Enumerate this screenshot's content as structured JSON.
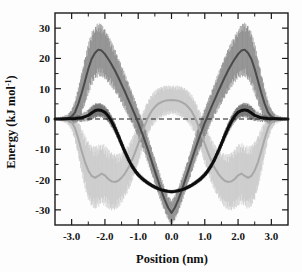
{
  "figure": {
    "background_color": "#fdfdfd",
    "frame_color": "#1a1a1a"
  },
  "chart_data": {
    "type": "line",
    "title": "",
    "subtitle": "",
    "xlabel": "Position (nm)",
    "ylabel": "Energy (kJ mol",
    "ylabel_superscript": "-1",
    "ylabel_suffix": ")",
    "xlim": [
      -3.5,
      3.5
    ],
    "ylim": [
      -35,
      35
    ],
    "xticks": [
      -3.0,
      -2.0,
      -1.0,
      0.0,
      1.0,
      2.0,
      3.0
    ],
    "xtick_labels": [
      "-3.0",
      "-2.0",
      "-1.0",
      "0.0",
      "1.0",
      "2.0",
      "3.0"
    ],
    "yticks": [
      -30,
      -20,
      -10,
      0,
      10,
      20,
      30
    ],
    "ytick_labels": [
      "-30",
      "-20",
      "-10",
      "0",
      "10",
      "20",
      "30"
    ],
    "minor_xticks": [
      -3.5,
      -2.5,
      -1.5,
      -0.5,
      0.5,
      1.5,
      2.5,
      3.5
    ],
    "minor_yticks": [
      -25,
      -15,
      -5,
      5,
      15,
      25
    ],
    "grid": false,
    "legend_position": "none",
    "zero_line": {
      "value": 0,
      "style": "dashed",
      "color": "#1a1a1a"
    },
    "series": [
      {
        "name": "total-energy",
        "color": "#0d0d0d",
        "width": 3.0,
        "error_color": "#5a5a5a",
        "x": [
          -3.5,
          -3.3,
          -3.1,
          -2.9,
          -2.7,
          -2.5,
          -2.4,
          -2.3,
          -2.2,
          -2.1,
          -2.0,
          -1.9,
          -1.8,
          -1.7,
          -1.6,
          -1.5,
          -1.4,
          -1.3,
          -1.2,
          -1.1,
          -1.0,
          -0.9,
          -0.8,
          -0.7,
          -0.6,
          -0.5,
          -0.4,
          -0.3,
          -0.2,
          -0.1,
          0.0,
          0.1,
          0.2,
          0.3,
          0.4,
          0.5,
          0.6,
          0.7,
          0.8,
          0.9,
          1.0,
          1.1,
          1.2,
          1.3,
          1.4,
          1.5,
          1.6,
          1.7,
          1.8,
          1.9,
          2.0,
          2.1,
          2.2,
          2.3,
          2.4,
          2.5,
          2.7,
          2.9,
          3.1,
          3.3,
          3.5
        ],
        "y": [
          0.0,
          0.0,
          0.1,
          0.2,
          0.4,
          1.2,
          2.0,
          2.7,
          3.0,
          2.8,
          2.2,
          1.0,
          -0.8,
          -3.0,
          -5.5,
          -8.2,
          -10.8,
          -13.2,
          -15.3,
          -17.0,
          -18.4,
          -19.5,
          -20.4,
          -21.2,
          -21.9,
          -22.5,
          -23.0,
          -23.4,
          -23.7,
          -23.9,
          -24.0,
          -23.9,
          -23.7,
          -23.4,
          -23.0,
          -22.5,
          -21.9,
          -21.2,
          -20.4,
          -19.5,
          -18.4,
          -17.0,
          -15.3,
          -13.2,
          -10.8,
          -8.2,
          -5.5,
          -3.0,
          -0.8,
          1.0,
          2.2,
          2.8,
          3.0,
          2.7,
          2.0,
          1.2,
          0.4,
          0.2,
          0.1,
          0.0,
          0.0
        ],
        "err": [
          0.2,
          0.3,
          0.5,
          0.8,
          1.2,
          1.6,
          1.9,
          2.0,
          2.0,
          1.9,
          1.8,
          1.7,
          1.6,
          1.5,
          1.4,
          1.3,
          1.2,
          1.1,
          1.0,
          0.9,
          0.8,
          0.8,
          0.7,
          0.7,
          0.6,
          0.6,
          0.6,
          0.5,
          0.5,
          0.5,
          0.5,
          0.5,
          0.5,
          0.5,
          0.6,
          0.6,
          0.6,
          0.7,
          0.7,
          0.8,
          0.8,
          0.9,
          1.0,
          1.1,
          1.2,
          1.3,
          1.4,
          1.5,
          1.6,
          1.7,
          1.8,
          1.9,
          2.0,
          2.0,
          1.9,
          1.6,
          1.2,
          0.8,
          0.5,
          0.3,
          0.2
        ]
      },
      {
        "name": "repulsive-component",
        "color": "#4a4a4a",
        "width": 2.0,
        "error_color": "#7d7d7d",
        "x": [
          -3.5,
          -3.3,
          -3.1,
          -3.0,
          -2.9,
          -2.8,
          -2.7,
          -2.6,
          -2.5,
          -2.4,
          -2.3,
          -2.2,
          -2.1,
          -2.0,
          -1.9,
          -1.8,
          -1.7,
          -1.6,
          -1.5,
          -1.4,
          -1.3,
          -1.2,
          -1.1,
          -1.0,
          -0.9,
          -0.8,
          -0.7,
          -0.6,
          -0.5,
          -0.4,
          -0.3,
          -0.2,
          -0.1,
          0.0,
          0.1,
          0.2,
          0.3,
          0.4,
          0.5,
          0.6,
          0.7,
          0.8,
          0.9,
          1.0,
          1.1,
          1.2,
          1.3,
          1.4,
          1.5,
          1.6,
          1.7,
          1.8,
          1.9,
          2.0,
          2.1,
          2.2,
          2.3,
          2.4,
          2.5,
          2.6,
          2.7,
          2.8,
          2.9,
          3.0,
          3.1,
          3.3,
          3.5
        ],
        "y": [
          0.0,
          0.1,
          0.3,
          0.8,
          2.2,
          5.0,
          8.5,
          12.5,
          16.5,
          19.8,
          21.8,
          22.9,
          22.6,
          21.4,
          19.8,
          18.0,
          16.0,
          13.8,
          11.4,
          9.0,
          6.5,
          4.0,
          1.4,
          -1.3,
          -4.2,
          -7.2,
          -10.4,
          -13.8,
          -17.2,
          -20.5,
          -23.8,
          -26.8,
          -29.3,
          -31.0,
          -29.3,
          -26.8,
          -23.8,
          -20.5,
          -17.2,
          -13.8,
          -10.4,
          -7.2,
          -4.2,
          -1.3,
          1.4,
          4.0,
          6.5,
          9.0,
          11.4,
          13.8,
          16.0,
          18.0,
          19.8,
          21.4,
          22.6,
          22.9,
          21.8,
          19.8,
          16.5,
          12.5,
          8.5,
          5.0,
          2.2,
          0.8,
          0.3,
          0.1,
          0.0
        ],
        "err": [
          0.3,
          0.6,
          1.2,
          2.0,
          3.2,
          4.5,
          5.6,
          6.4,
          7.0,
          7.3,
          7.4,
          7.3,
          7.1,
          6.8,
          6.5,
          6.2,
          5.9,
          5.6,
          5.3,
          5.0,
          4.7,
          4.4,
          4.2,
          4.0,
          3.9,
          3.8,
          3.7,
          3.6,
          3.5,
          3.5,
          3.4,
          3.4,
          3.4,
          3.4,
          3.4,
          3.4,
          3.4,
          3.5,
          3.5,
          3.6,
          3.7,
          3.8,
          3.9,
          4.0,
          4.2,
          4.4,
          4.7,
          5.0,
          5.3,
          5.6,
          5.9,
          6.2,
          6.5,
          6.8,
          7.1,
          7.3,
          7.4,
          7.3,
          7.0,
          6.4,
          5.6,
          4.5,
          3.2,
          2.0,
          1.2,
          0.6,
          0.3
        ]
      },
      {
        "name": "attractive-component",
        "color": "#a8a8a8",
        "width": 2.0,
        "error_color": "#c4c4c4",
        "x": [
          -3.5,
          -3.3,
          -3.1,
          -3.0,
          -2.9,
          -2.8,
          -2.7,
          -2.6,
          -2.5,
          -2.4,
          -2.3,
          -2.2,
          -2.1,
          -2.0,
          -1.9,
          -1.8,
          -1.7,
          -1.6,
          -1.5,
          -1.4,
          -1.3,
          -1.2,
          -1.1,
          -1.0,
          -0.9,
          -0.8,
          -0.7,
          -0.6,
          -0.5,
          -0.4,
          -0.3,
          -0.2,
          -0.1,
          0.0,
          0.1,
          0.2,
          0.3,
          0.4,
          0.5,
          0.6,
          0.7,
          0.8,
          0.9,
          1.0,
          1.1,
          1.2,
          1.3,
          1.4,
          1.5,
          1.6,
          1.7,
          1.8,
          1.9,
          2.0,
          2.1,
          2.2,
          2.3,
          2.4,
          2.5,
          2.6,
          2.7,
          2.8,
          2.9,
          3.0,
          3.1,
          3.3,
          3.5
        ],
        "y": [
          0.0,
          -0.1,
          -0.4,
          -1.0,
          -3.0,
          -6.5,
          -10.5,
          -14.2,
          -17.0,
          -18.8,
          -19.4,
          -18.8,
          -18.0,
          -18.6,
          -19.8,
          -20.6,
          -20.8,
          -20.4,
          -19.4,
          -18.0,
          -16.2,
          -13.9,
          -11.2,
          -8.2,
          -5.0,
          -2.0,
          0.6,
          2.6,
          4.0,
          5.0,
          5.6,
          6.0,
          6.2,
          6.3,
          6.2,
          6.0,
          5.6,
          5.0,
          4.0,
          2.6,
          0.6,
          -2.0,
          -5.0,
          -8.2,
          -11.2,
          -13.9,
          -16.2,
          -18.0,
          -19.4,
          -20.4,
          -20.8,
          -20.6,
          -19.8,
          -18.6,
          -18.0,
          -18.8,
          -19.4,
          -18.8,
          -17.0,
          -14.2,
          -10.5,
          -6.5,
          -3.0,
          -1.0,
          -0.4,
          -0.1,
          0.0
        ],
        "err": [
          0.3,
          0.6,
          1.3,
          2.2,
          3.5,
          5.0,
          6.2,
          7.2,
          7.9,
          8.3,
          8.5,
          8.5,
          8.4,
          8.3,
          8.1,
          7.9,
          7.6,
          7.3,
          7.0,
          6.7,
          6.4,
          6.1,
          5.8,
          5.5,
          5.2,
          5.0,
          4.8,
          4.6,
          4.4,
          4.3,
          4.2,
          4.1,
          4.0,
          4.0,
          4.0,
          4.1,
          4.2,
          4.3,
          4.4,
          4.6,
          4.8,
          5.0,
          5.2,
          5.5,
          5.8,
          6.1,
          6.4,
          6.7,
          7.0,
          7.3,
          7.6,
          7.9,
          8.1,
          8.3,
          8.4,
          8.5,
          8.5,
          8.3,
          7.9,
          7.2,
          6.2,
          5.0,
          3.5,
          2.2,
          1.3,
          0.6,
          0.3
        ]
      }
    ]
  }
}
